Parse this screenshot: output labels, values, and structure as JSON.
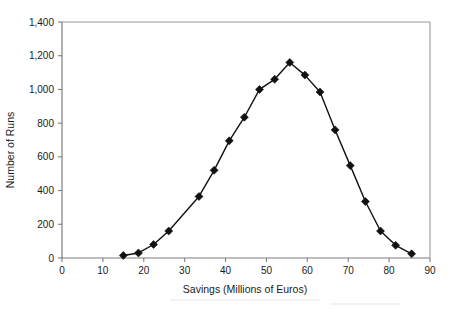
{
  "chart_data": {
    "type": "line",
    "title": "",
    "xlabel": "Savings (Millions of Euros)",
    "ylabel": "Number of Runs",
    "xlim": [
      0,
      90
    ],
    "ylim": [
      0,
      1400
    ],
    "xticks": [
      0,
      10,
      20,
      30,
      40,
      50,
      60,
      70,
      80,
      90
    ],
    "xtick_labels": [
      "0",
      "10",
      "20",
      "30",
      "40",
      "50",
      "60",
      "70",
      "80",
      "90"
    ],
    "yticks": [
      0,
      200,
      400,
      600,
      800,
      1000,
      1200,
      1400
    ],
    "ytick_labels": [
      "0",
      "200",
      "400",
      "600",
      "800",
      "1,000",
      "1,200",
      "1,400"
    ],
    "grid": false,
    "legend": null,
    "marker": "diamond",
    "marker_color": "#111111",
    "line_color": "#111111",
    "x": [
      15.0,
      18.7,
      22.4,
      26.1,
      33.5,
      37.2,
      40.9,
      44.6,
      48.3,
      52.0,
      55.7,
      59.4,
      63.1,
      66.8,
      70.5,
      74.2,
      77.9,
      81.6,
      85.5
    ],
    "y": [
      15,
      30,
      80,
      160,
      365,
      520,
      695,
      835,
      1000,
      1060,
      1160,
      1085,
      985,
      760,
      548,
      335,
      160,
      75,
      25
    ],
    "points": [
      {
        "x": 15.0,
        "y": 15
      },
      {
        "x": 18.7,
        "y": 30
      },
      {
        "x": 22.4,
        "y": 80
      },
      {
        "x": 26.1,
        "y": 160
      },
      {
        "x": 33.5,
        "y": 365
      },
      {
        "x": 37.2,
        "y": 520
      },
      {
        "x": 40.9,
        "y": 695
      },
      {
        "x": 44.6,
        "y": 835
      },
      {
        "x": 48.3,
        "y": 1000
      },
      {
        "x": 52.0,
        "y": 1060
      },
      {
        "x": 55.7,
        "y": 1160
      },
      {
        "x": 59.4,
        "y": 1085
      },
      {
        "x": 63.1,
        "y": 985
      },
      {
        "x": 66.8,
        "y": 760
      },
      {
        "x": 70.5,
        "y": 548
      },
      {
        "x": 74.2,
        "y": 335
      },
      {
        "x": 77.9,
        "y": 160
      },
      {
        "x": 81.6,
        "y": 75
      },
      {
        "x": 85.5,
        "y": 25
      }
    ]
  },
  "colors": {
    "background": "#ffffff",
    "line": "#111111",
    "marker": "#111111",
    "axis": "#7d7d7d",
    "frame": "#9a9a9a",
    "text": "#1a1a1a"
  }
}
